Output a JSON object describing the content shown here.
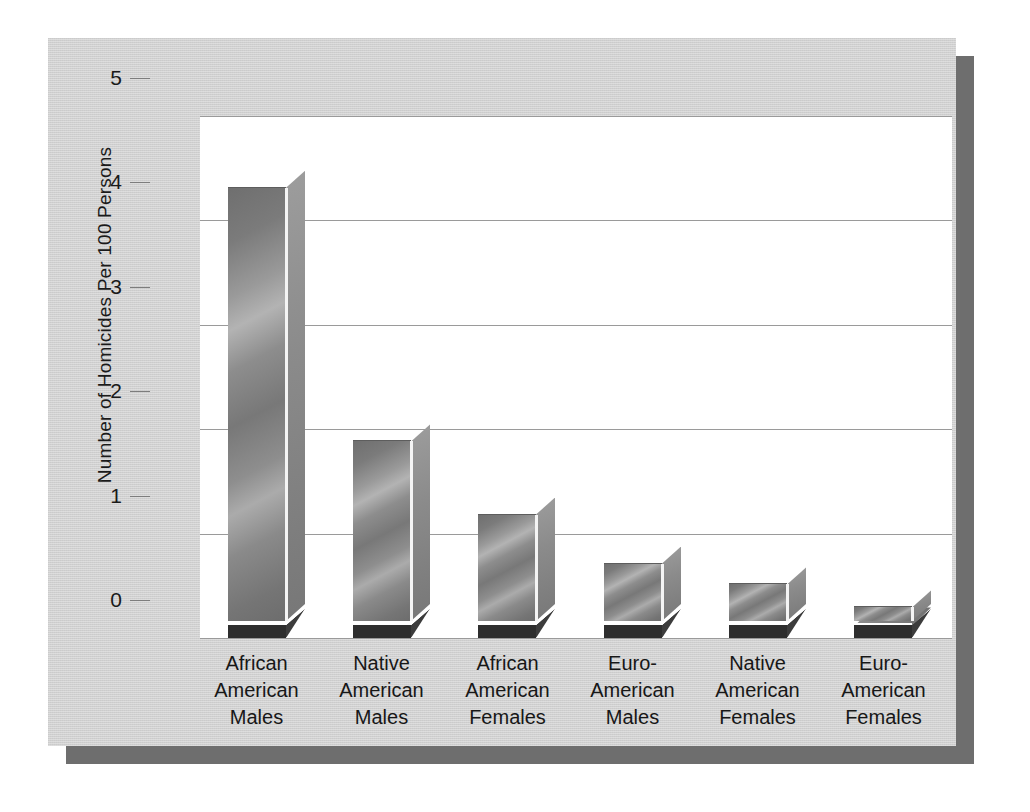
{
  "chart_data": {
    "type": "bar",
    "title": "",
    "xlabel": "",
    "ylabel": "Number of Homicides Per 100 Persons",
    "ylim": [
      0,
      5
    ],
    "ytick_labels": [
      "5",
      "4",
      "3",
      "2",
      "1",
      "0"
    ],
    "ytick_values": [
      5,
      4,
      3,
      2,
      1,
      0
    ],
    "grid": true,
    "legend": "none",
    "style": "3d-bar",
    "categories": [
      "African American Males",
      "Native American Males",
      "African American Females",
      "Euro-American Males",
      "Native American Females",
      "Euro-American Females"
    ],
    "category_lines": [
      [
        "African",
        "American",
        "Males"
      ],
      [
        "Native",
        "American",
        "Males"
      ],
      [
        "African",
        "American",
        "Females"
      ],
      [
        "Euro-",
        "American",
        "Males"
      ],
      [
        "Native",
        "American",
        "Females"
      ],
      [
        "Euro-",
        "American",
        "Females"
      ]
    ],
    "values": [
      4.15,
      1.72,
      1.02,
      0.55,
      0.35,
      0.13
    ],
    "colors": {
      "card_background": "#d0d0d0",
      "card_shadow": "#6e6e6e",
      "plot_background": "#ffffff",
      "gridline": "#9a9a9a",
      "bar_front": "#8d8d8d",
      "bar_side": "#8b8b8b",
      "bar_base": "#2e2e2e",
      "text": "#1a1a1a"
    }
  }
}
